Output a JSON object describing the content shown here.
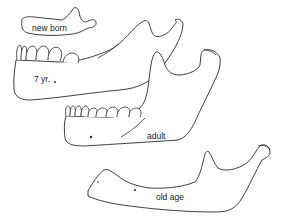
{
  "figure": {
    "stages": [
      {
        "id": "newborn",
        "label": "new born"
      },
      {
        "id": "seven_years",
        "label": "7 yr."
      },
      {
        "id": "adult",
        "label": "adult"
      },
      {
        "id": "old_age",
        "label": "old age"
      }
    ],
    "colors": {
      "background": "#ffffff",
      "stroke": "#2a2a2a"
    }
  }
}
